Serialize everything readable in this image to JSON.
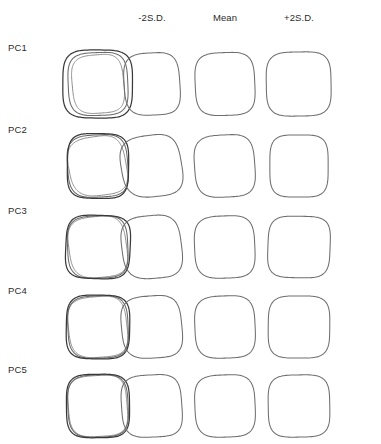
{
  "figure": {
    "type": "shape-outline-matrix",
    "background_color": "#ffffff",
    "stroke_color": "#6e6e6e",
    "label_color": "#2b2b2b"
  },
  "columns": [
    {
      "key": "overlay",
      "label": "",
      "center_x": 98,
      "has_header": false
    },
    {
      "key": "minus2sd",
      "label": "-2S.D.",
      "center_x": 152,
      "has_header": true
    },
    {
      "key": "mean",
      "label": "Mean",
      "center_x": 225,
      "has_header": true
    },
    {
      "key": "plus2sd",
      "label": "+2S.D.",
      "center_x": 299,
      "has_header": true
    }
  ],
  "rows": [
    {
      "key": "pc1",
      "label": "PC1",
      "label_y": 42,
      "cell_y": 44
    },
    {
      "key": "pc2",
      "label": "PC2",
      "label_y": 124,
      "cell_y": 126
    },
    {
      "key": "pc3",
      "label": "PC3",
      "label_y": 205,
      "cell_y": 207
    },
    {
      "key": "pc4",
      "label": "PC4",
      "label_y": 285,
      "cell_y": 287
    },
    {
      "key": "pc5",
      "label": "PC5",
      "label_y": 364,
      "cell_y": 366
    }
  ],
  "chart_data": {
    "type": "line",
    "title": "",
    "xlabel": "",
    "ylabel": "",
    "categories": [
      "-2S.D.",
      "Mean",
      "+2S.D."
    ],
    "series": [
      {
        "name": "PC1",
        "overlay_spread": 0.075,
        "outlines": {
          "minus2sd": {
            "w": 0.86,
            "h": 0.96,
            "squareness": 3.5,
            "tilt": -3,
            "skew_x": 0.02,
            "bulge_top": 0.02,
            "bulge_left": 0.0
          },
          "mean": {
            "w": 0.92,
            "h": 0.97,
            "squareness": 3.6,
            "tilt": -2,
            "skew_x": 0.01,
            "bulge_top": 0.01,
            "bulge_left": 0.0
          },
          "plus2sd": {
            "w": 1.0,
            "h": 0.99,
            "squareness": 3.8,
            "tilt": -1,
            "skew_x": 0.0,
            "bulge_top": 0.0,
            "bulge_left": 0.01
          }
        }
      },
      {
        "name": "PC2",
        "overlay_spread": 0.05,
        "outlines": {
          "minus2sd": {
            "w": 0.93,
            "h": 0.95,
            "squareness": 3.2,
            "tilt": -7,
            "skew_x": 0.05,
            "bulge_top": 0.03,
            "bulge_left": 0.02
          },
          "mean": {
            "w": 0.93,
            "h": 0.96,
            "squareness": 3.5,
            "tilt": -3,
            "skew_x": 0.02,
            "bulge_top": 0.01,
            "bulge_left": 0.01
          },
          "plus2sd": {
            "w": 0.9,
            "h": 0.96,
            "squareness": 3.9,
            "tilt": 0,
            "skew_x": 0.0,
            "bulge_top": 0.0,
            "bulge_left": 0.0
          }
        }
      },
      {
        "name": "PC3",
        "overlay_spread": 0.035,
        "outlines": {
          "minus2sd": {
            "w": 0.92,
            "h": 0.97,
            "squareness": 3.3,
            "tilt": -5,
            "skew_x": 0.04,
            "bulge_top": 0.02,
            "bulge_left": 0.01
          },
          "mean": {
            "w": 0.93,
            "h": 0.96,
            "squareness": 3.5,
            "tilt": -2,
            "skew_x": 0.01,
            "bulge_top": 0.01,
            "bulge_left": 0.01
          },
          "plus2sd": {
            "w": 0.96,
            "h": 0.95,
            "squareness": 3.9,
            "tilt": 1,
            "skew_x": -0.02,
            "bulge_top": 0.0,
            "bulge_left": 0.0
          }
        }
      },
      {
        "name": "PC4",
        "overlay_spread": 0.03,
        "outlines": {
          "minus2sd": {
            "w": 0.93,
            "h": 0.96,
            "squareness": 3.4,
            "tilt": -4,
            "skew_x": 0.03,
            "bulge_top": 0.02,
            "bulge_left": 0.01
          },
          "mean": {
            "w": 0.93,
            "h": 0.96,
            "squareness": 3.5,
            "tilt": -2,
            "skew_x": 0.01,
            "bulge_top": 0.01,
            "bulge_left": 0.0
          },
          "plus2sd": {
            "w": 0.95,
            "h": 0.96,
            "squareness": 3.8,
            "tilt": 0,
            "skew_x": -0.01,
            "bulge_top": 0.0,
            "bulge_left": 0.0
          }
        }
      },
      {
        "name": "PC5",
        "overlay_spread": 0.025,
        "outlines": {
          "minus2sd": {
            "w": 0.93,
            "h": 0.96,
            "squareness": 3.6,
            "tilt": -3,
            "skew_x": 0.02,
            "bulge_top": 0.01,
            "bulge_left": 0.01
          },
          "mean": {
            "w": 0.93,
            "h": 0.96,
            "squareness": 3.5,
            "tilt": -2,
            "skew_x": 0.01,
            "bulge_top": 0.01,
            "bulge_left": 0.0
          },
          "plus2sd": {
            "w": 0.95,
            "h": 0.96,
            "squareness": 3.8,
            "tilt": -1,
            "skew_x": 0.0,
            "bulge_top": 0.0,
            "bulge_left": 0.0
          }
        }
      }
    ]
  }
}
